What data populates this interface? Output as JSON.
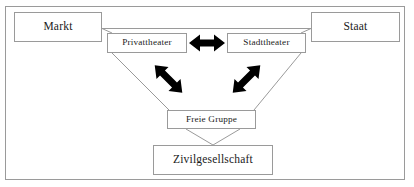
{
  "diagram": {
    "frame": {
      "name": "outer-frame",
      "border_color": "#9a9a9a"
    },
    "nodes": [
      {
        "id": "markt",
        "label": "Markt"
      },
      {
        "id": "staat",
        "label": "Staat"
      },
      {
        "id": "privattheater",
        "label": "Privattheater"
      },
      {
        "id": "stadttheater",
        "label": "Stadttheater"
      },
      {
        "id": "freie_gruppe",
        "label": "Freie Gruppe"
      },
      {
        "id": "zivilgesellschaft",
        "label": "Zivilgesellschaft"
      }
    ],
    "arrows": [
      {
        "id": "arrow-privattheater-stadttheater",
        "label": "doppelpfeil-horizontal",
        "from": "privattheater",
        "to": "stadttheater",
        "style": "double-headed",
        "color": "#000000"
      },
      {
        "id": "arrow-privattheater-freie-gruppe",
        "label": "doppelpfeil-diagonal-links",
        "from": "privattheater",
        "to": "freie_gruppe",
        "style": "double-headed",
        "color": "#000000"
      },
      {
        "id": "arrow-stadttheater-freie-gruppe",
        "label": "doppelpfeil-diagonal-rechts",
        "from": "stadttheater",
        "to": "freie_gruppe",
        "style": "double-headed",
        "color": "#000000"
      }
    ],
    "connectors": [
      {
        "id": "line-markt-staat",
        "from": "markt",
        "to": "staat",
        "style": "plain-line"
      },
      {
        "id": "line-markt-privattheater",
        "from": "markt",
        "to": "privattheater",
        "style": "plain-line"
      },
      {
        "id": "line-staat-stadttheater",
        "from": "staat",
        "to": "stadttheater",
        "style": "plain-line"
      },
      {
        "id": "line-privattheater-freie-gruppe",
        "from": "privattheater",
        "to": "freie_gruppe",
        "style": "plain-line"
      },
      {
        "id": "line-stadttheater-freie-gruppe",
        "from": "stadttheater",
        "to": "freie_gruppe",
        "style": "plain-line"
      },
      {
        "id": "line-freie-gruppe-zivilgesellschaft-left",
        "from": "freie_gruppe",
        "to": "zivilgesellschaft",
        "style": "plain-line"
      },
      {
        "id": "line-freie-gruppe-zivilgesellschaft-right",
        "from": "freie_gruppe",
        "to": "zivilgesellschaft",
        "style": "plain-line"
      }
    ],
    "colors": {
      "line": "#9a9a9a",
      "arrow": "#000000",
      "text": "#1a1a1a",
      "background": "#ffffff"
    }
  }
}
